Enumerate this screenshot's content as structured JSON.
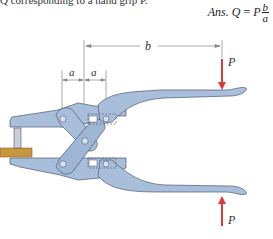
{
  "problem_text": {
    "partial_line": "Q corresponding to a hand grip P."
  },
  "answer": {
    "prefix": "Ans.",
    "lhs": "Q",
    "equals": "=",
    "coef": "P",
    "numerator": "b",
    "denominator": "a"
  },
  "figure": {
    "labels": {
      "a_left": "a",
      "a_right": "a",
      "b": "b",
      "p_top": "P",
      "p_bottom": "P"
    },
    "colors": {
      "body": "#a9bedb",
      "body_dark": "#8ea6c8",
      "outline": "#4a5a70",
      "force_arrow": "#e0383a",
      "wood_block": "#c8963e",
      "dim_line": "#888888",
      "pin": "#d8e2ee"
    }
  }
}
